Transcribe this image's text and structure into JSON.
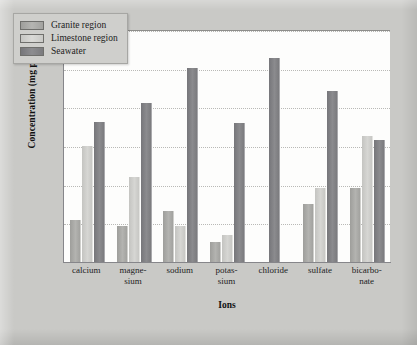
{
  "chart_data": {
    "type": "bar",
    "title": "",
    "xlabel": "Ions",
    "ylabel": "Concentration (mg per L)",
    "yscale": "log",
    "ylim": [
      0.1,
      100000
    ],
    "ytick_labels": [
      "10⁵",
      "10⁴",
      "10³",
      "10²",
      "10¹",
      "10⁰",
      "10⁻¹"
    ],
    "ytick_values": [
      100000,
      10000,
      1000,
      100,
      10,
      1,
      0.1
    ],
    "grid": true,
    "legend_position": "top-left",
    "categories": [
      "calcium",
      "magnesium",
      "sodium",
      "potassium",
      "chloride",
      "sulfate",
      "bicarbonate"
    ],
    "category_labels": [
      {
        "line1": "calcium",
        "line2": ""
      },
      {
        "line1": "magne-",
        "line2": "sium"
      },
      {
        "line1": "sodium",
        "line2": ""
      },
      {
        "line1": "potas-",
        "line2": "sium"
      },
      {
        "line1": "chloride",
        "line2": ""
      },
      {
        "line1": "sulfate",
        "line2": ""
      },
      {
        "line1": "bicarbo-",
        "line2": "nate"
      }
    ],
    "series": [
      {
        "name": "Granite region",
        "color": "#a8a8a5",
        "values": [
          1.2,
          0.85,
          2.1,
          0.33,
          0,
          3.1,
          8.0
        ]
      },
      {
        "name": "Limestone region",
        "color": "#d0d0cd",
        "values": [
          100,
          16,
          0.85,
          0.5,
          0,
          8.0,
          180
        ]
      },
      {
        "name": "Seawater",
        "color": "#828286",
        "values": [
          420,
          1300,
          10500,
          400,
          19000,
          2700,
          140
        ]
      }
    ]
  },
  "legend": {
    "items": [
      {
        "label": "Granite region",
        "swatch": "granite"
      },
      {
        "label": "Limestone region",
        "swatch": "limestone"
      },
      {
        "label": "Seawater",
        "swatch": "seawater"
      }
    ]
  },
  "colors": {
    "background": "#c9c9c6",
    "plot_background": "#fdfdfc",
    "gridline": "#b9b9b6",
    "axis": "#86868a",
    "legend_background": "#cfcfcc",
    "text": "#1d1d1d"
  }
}
